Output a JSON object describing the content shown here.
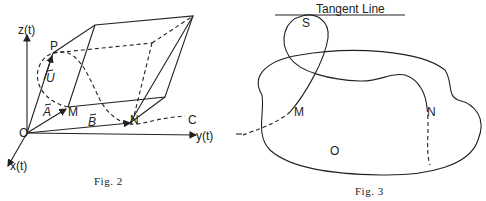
{
  "figures": [
    {
      "id": "fig2",
      "caption": "Fig. 2",
      "axes": {
        "z": "z(t)",
        "y": "y(t)",
        "x": "x(t)"
      },
      "points": {
        "origin": "O",
        "P": "P",
        "M": "M",
        "N": "N",
        "C": "C"
      },
      "vectors": {
        "U": "U",
        "A": "A",
        "B": "B"
      }
    },
    {
      "id": "fig3",
      "caption": "Fig. 3",
      "tangent_label": "Tangent Line",
      "points": {
        "S": "S",
        "M": "M",
        "N": "N",
        "O": "O"
      }
    }
  ]
}
